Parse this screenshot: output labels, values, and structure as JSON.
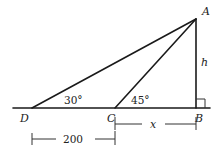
{
  "diagram": {
    "type": "geometry-triangle",
    "points": {
      "A": {
        "label": "A",
        "x": 196,
        "y": 19
      },
      "B": {
        "label": "B",
        "x": 196,
        "y": 108
      },
      "C": {
        "label": "C",
        "x": 115,
        "y": 108
      },
      "D": {
        "label": "D",
        "x": 32,
        "y": 108
      }
    },
    "angles": {
      "D": "30°",
      "C": "45°",
      "B": "right-angle"
    },
    "lengths": {
      "AB": "h",
      "CB": "x",
      "DC": "200"
    },
    "colors": {
      "stroke": "#1a1a1a",
      "background": "#ffffff"
    }
  }
}
